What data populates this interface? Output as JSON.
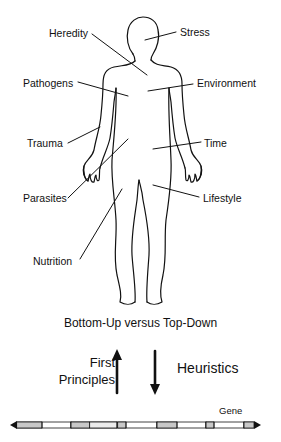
{
  "figure": {
    "factors": {
      "heredity": "Heredity",
      "stress": "Stress",
      "pathogens": "Pathogens",
      "environment": "Environment",
      "trauma": "Trauma",
      "time": "Time",
      "parasites": "Parasites",
      "lifestyle": "Lifestyle",
      "nutrition": "Nutrition"
    },
    "approach_title": "Bottom-Up versus Top-Down",
    "left_label_line1": "First",
    "left_label_line2": "Principles",
    "right_label": "Heuristics",
    "up_arrow_icon": "arrow-up-icon",
    "down_arrow_icon": "arrow-down-icon",
    "gene_label": "Gene",
    "colors": {
      "ink": "#111111",
      "exon_fill": "#c8c8c8",
      "intron_fill": "#ffffff"
    }
  }
}
